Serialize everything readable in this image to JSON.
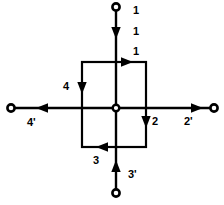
{
  "diagram": {
    "type": "circuit-schematic",
    "colors": {
      "line": "#000000",
      "background": "#ffffff",
      "label": "#000000"
    },
    "geometry": {
      "width": 224,
      "height": 205,
      "center": {
        "x": 116,
        "y": 108
      },
      "box": {
        "left": 82,
        "top": 62,
        "right": 146,
        "bottom": 147
      },
      "terminals": {
        "top": {
          "x": 116,
          "y": 7
        },
        "left": {
          "x": 11,
          "y": 108
        },
        "right": {
          "x": 214,
          "y": 108
        },
        "bottom": {
          "x": 116,
          "y": 193
        }
      }
    },
    "labels": [
      {
        "id": "label-top-terminal",
        "text": "1",
        "x": 133,
        "y": 5,
        "name": "label-branch-1-terminal"
      },
      {
        "id": "label-top-lead",
        "text": "1",
        "x": 133,
        "y": 26,
        "name": "label-branch-1-lead"
      },
      {
        "id": "label-box-top",
        "text": "1",
        "x": 133,
        "y": 46,
        "name": "label-box-edge-1"
      },
      {
        "id": "label-box-left",
        "text": "4",
        "x": 63,
        "y": 81,
        "name": "label-box-edge-4"
      },
      {
        "id": "label-left-terminal",
        "text": "4'",
        "x": 27,
        "y": 117,
        "name": "label-branch-4-prime"
      },
      {
        "id": "label-box-right",
        "text": "2",
        "x": 152,
        "y": 116,
        "name": "label-box-edge-2"
      },
      {
        "id": "label-right-terminal",
        "text": "2'",
        "x": 184,
        "y": 116,
        "name": "label-branch-2-prime"
      },
      {
        "id": "label-box-bottom",
        "text": "3",
        "x": 93,
        "y": 155,
        "name": "label-box-edge-3"
      },
      {
        "id": "label-bottom-lead",
        "text": "3'",
        "x": 128,
        "y": 169,
        "name": "label-branch-3-prime"
      }
    ],
    "arrows": [
      {
        "name": "arrow-top-lead-down",
        "direction": "down",
        "on": "top-lead"
      },
      {
        "name": "arrow-box-top-right",
        "direction": "right",
        "on": "box-top-edge"
      },
      {
        "name": "arrow-box-left-down",
        "direction": "down",
        "on": "box-left-edge"
      },
      {
        "name": "arrow-box-right-down",
        "direction": "down",
        "on": "box-right-edge"
      },
      {
        "name": "arrow-box-bottom-left",
        "direction": "left",
        "on": "box-bottom-edge"
      },
      {
        "name": "arrow-left-lead-left",
        "direction": "left",
        "on": "left-lead"
      },
      {
        "name": "arrow-right-lead-right",
        "direction": "right",
        "on": "right-lead"
      },
      {
        "name": "arrow-bottom-lead-up",
        "direction": "up",
        "on": "bottom-lead"
      }
    ]
  }
}
